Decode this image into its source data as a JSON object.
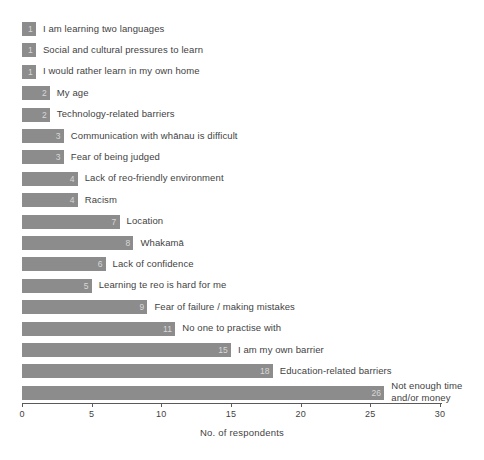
{
  "chart_data": {
    "type": "bar",
    "orientation": "horizontal",
    "title": "",
    "xlabel": "No. of respondents",
    "ylabel": "",
    "xlim": [
      0,
      30
    ],
    "xticks": [
      0,
      5,
      10,
      15,
      20,
      25,
      30
    ],
    "grid": false,
    "legend": null,
    "bar_color": "#8c8c8c",
    "value_label_color": "#d8d8d8",
    "categories": [
      "I am learning two languages",
      "Social and cultural pressures to learn",
      "I would rather learn in my own home",
      "My age",
      "Technology-related barriers",
      "Communication with whānau is difficult",
      "Fear of being judged",
      "Lack of reo-friendly environment",
      "Racism",
      "Location",
      "Whakamā",
      "Lack of confidence",
      "Learning te reo is hard for me",
      "Fear of failure / making mistakes",
      "No one to practise with",
      "I am my own barrier",
      "Education-related barriers",
      "Not enough time and/or money"
    ],
    "values": [
      1,
      1,
      1,
      2,
      2,
      3,
      3,
      4,
      4,
      7,
      8,
      6,
      5,
      9,
      11,
      15,
      18,
      26
    ],
    "value_labels": [
      "1",
      "1",
      "1",
      "2",
      "2",
      "3",
      "3",
      "4",
      "4",
      "7",
      "8",
      "6",
      "5",
      "9",
      "11",
      "15",
      "18",
      "26"
    ]
  }
}
